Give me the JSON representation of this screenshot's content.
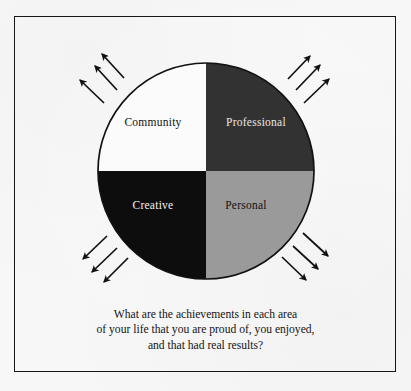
{
  "figure": {
    "type": "quadrant-wheel-diagram",
    "title_text": "",
    "frame": {
      "border_color": "#171717",
      "background_color": "#f7f7f7"
    },
    "wheel": {
      "name": "life-areas-wheel",
      "center_x": 206,
      "center_y": 171,
      "radius": 108,
      "outline_color": "#111111",
      "quadrants": [
        {
          "id": "community",
          "label": "Community",
          "position": "top-left",
          "fill": "#fbfbfb",
          "text_color": "#111111"
        },
        {
          "id": "professional",
          "label": "Professional",
          "position": "top-right",
          "fill": "#323232",
          "text_color": "#e8e8e8"
        },
        {
          "id": "creative",
          "label": "Creative",
          "position": "bottom-left",
          "fill": "#0d0d0d",
          "text_color": "#f2f2f2"
        },
        {
          "id": "personal",
          "label": "Personal",
          "position": "bottom-right",
          "fill": "#9a9a9a",
          "text_color": "#111111"
        }
      ]
    },
    "arrow_groups": [
      {
        "id": "arrows-top-left",
        "direction": "up-left",
        "count": 3,
        "color": "#111111"
      },
      {
        "id": "arrows-top-right",
        "direction": "up-right",
        "count": 3,
        "color": "#111111"
      },
      {
        "id": "arrows-bottom-left",
        "direction": "down-left",
        "count": 3,
        "color": "#111111"
      },
      {
        "id": "arrows-bottom-right",
        "direction": "down-right",
        "count": 3,
        "color": "#111111"
      }
    ],
    "caption": {
      "line1": "What are the achievements in each area",
      "line2": "of your life that you are proud of, you enjoyed,",
      "line3": "and that had real results?",
      "color": "#131313"
    }
  }
}
